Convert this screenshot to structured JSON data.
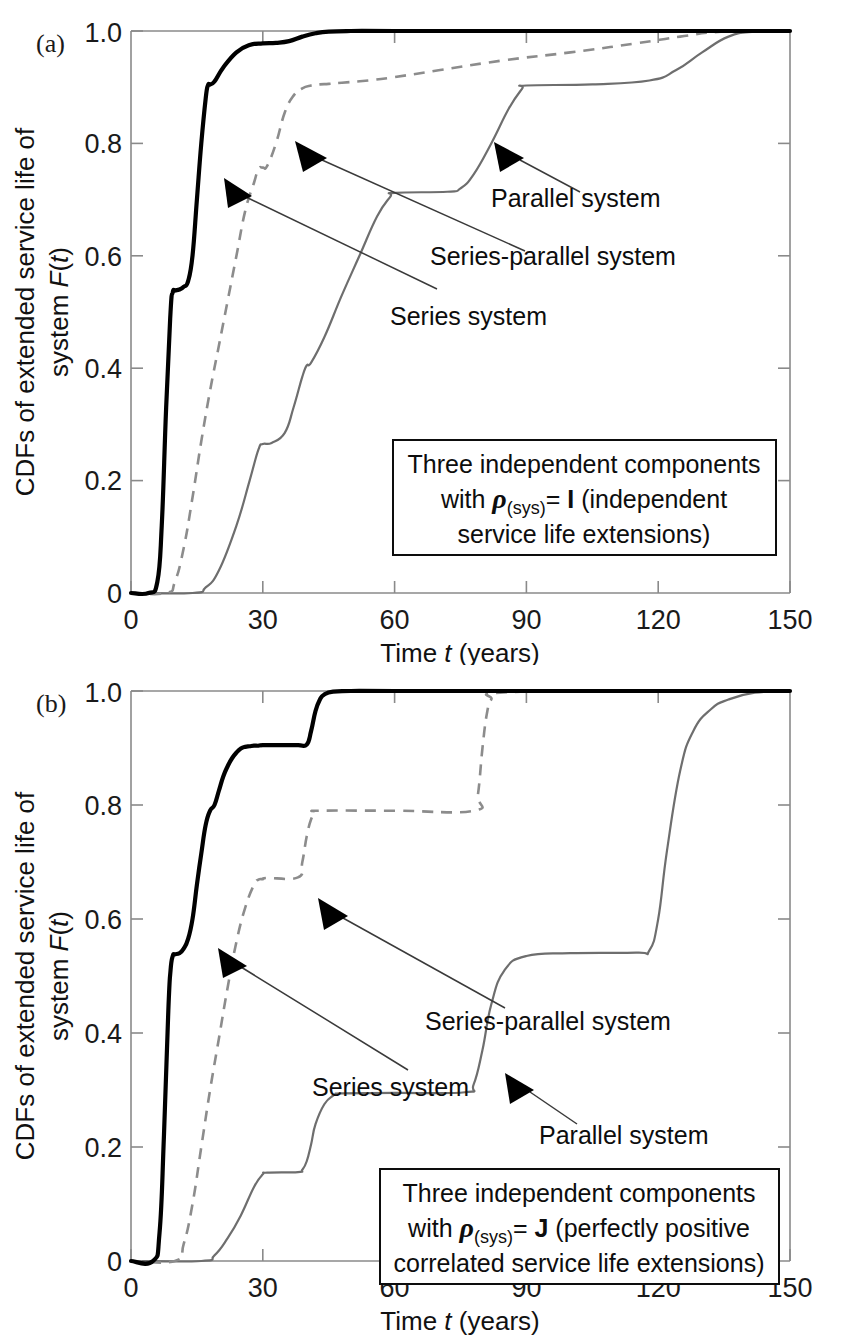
{
  "figure": {
    "panels": [
      {
        "tag": "(a)",
        "box_lines": [
          "Three independent components",
          "with ρ(sys)= I (independent",
          "service life extensions)"
        ],
        "box_line1": "Three independent components",
        "box_line2_pre": "with ",
        "box_line2_sym": "ρ",
        "box_line2_sub": "(sys)",
        "box_line2_post": "= ",
        "box_line2_matrix": "I",
        "box_line2_tail": " (independent",
        "box_line3": "service life extensions)",
        "labels": {
          "series": "Series system",
          "series_parallel": "Series-parallel  system",
          "parallel": "Parallel system"
        }
      },
      {
        "tag": "(b)",
        "box_lines": [
          "Three independent components",
          "with ρ(sys)= J (perfectly positive",
          "correlated service life extensions)"
        ],
        "box_line1": "Three independent components",
        "box_line2_pre": "with ",
        "box_line2_sym": "ρ",
        "box_line2_sub": "(sys)",
        "box_line2_post": "= ",
        "box_line2_matrix": "J",
        "box_line2_tail": " (perfectly positive",
        "box_line3": "correlated service life extensions)",
        "labels": {
          "series": "Series system",
          "series_parallel": "Series-parallel  system",
          "parallel": "Parallel system"
        }
      }
    ],
    "axis": {
      "xlabel_pre": "Time ",
      "xlabel_var": "t",
      "xlabel_post": " (years)",
      "ylabel_line1": "CDFs of extended service life of",
      "ylabel_line2_pre": "system ",
      "ylabel_line2_var": "F",
      "ylabel_line2_post": "(",
      "ylabel_line2_var2": "t",
      "ylabel_line2_end": ")",
      "xticks": [
        "0",
        "30",
        "60",
        "90",
        "120",
        "150"
      ],
      "yticks": [
        "0",
        "0.2",
        "0.4",
        "0.6",
        "0.8",
        "1.0"
      ]
    }
  },
  "chart_data": [
    {
      "type": "line",
      "panel": "(a)",
      "title": "CDFs of extended service life of system F(t) — independent service life extensions",
      "xlabel": "Time t (years)",
      "ylabel": "CDFs of extended service life of system F(t)",
      "xlim": [
        0,
        150
      ],
      "ylim": [
        0,
        1.0
      ],
      "xticks": [
        0,
        30,
        60,
        90,
        120,
        150
      ],
      "yticks": [
        0,
        0.2,
        0.4,
        0.6,
        0.8,
        1.0
      ],
      "grid": false,
      "legend": "inline annotations with arrows",
      "annotation_box": "Three independent components with rho_(sys)= I (independent service life extensions)",
      "series": [
        {
          "name": "Series system",
          "style": "solid-thick-black",
          "x": [
            0,
            4,
            6,
            7,
            8,
            9,
            9.5,
            10,
            11,
            12,
            13,
            14,
            15,
            16,
            17,
            17.5,
            18,
            19,
            21,
            24,
            27,
            30,
            33,
            36,
            39,
            42,
            45,
            50,
            60,
            80,
            100,
            120,
            150
          ],
          "y": [
            0,
            0.0,
            0.02,
            0.12,
            0.33,
            0.5,
            0.535,
            0.538,
            0.54,
            0.545,
            0.555,
            0.6,
            0.7,
            0.8,
            0.88,
            0.903,
            0.905,
            0.91,
            0.935,
            0.962,
            0.975,
            0.978,
            0.979,
            0.982,
            0.99,
            0.996,
            0.999,
            1.0,
            1.0,
            1.0,
            1.0,
            1.0,
            1.0
          ]
        },
        {
          "name": "Series-parallel  system",
          "style": "dashed-gray",
          "x": [
            0,
            8,
            10,
            12,
            14,
            16,
            18,
            20,
            22,
            24,
            26,
            28,
            29,
            30,
            31,
            33,
            35,
            37,
            39,
            41,
            43,
            45,
            48,
            54,
            60,
            70,
            85,
            100,
            115,
            125,
            135,
            150
          ],
          "y": [
            0,
            0.0,
            0.02,
            0.08,
            0.17,
            0.27,
            0.36,
            0.44,
            0.52,
            0.6,
            0.68,
            0.73,
            0.755,
            0.757,
            0.76,
            0.8,
            0.855,
            0.885,
            0.898,
            0.903,
            0.905,
            0.906,
            0.908,
            0.912,
            0.918,
            0.93,
            0.948,
            0.962,
            0.978,
            0.99,
            0.999,
            1.0
          ]
        },
        {
          "name": "Parallel system",
          "style": "solid-thin-gray",
          "x": [
            0,
            14,
            17,
            20,
            24,
            27,
            29,
            30,
            32,
            35,
            37,
            39,
            40,
            41,
            44,
            48,
            52,
            56,
            59,
            60,
            72,
            75,
            78,
            82,
            86,
            89,
            90,
            105,
            118,
            124,
            130,
            136,
            142,
            150
          ],
          "y": [
            0,
            0.0,
            0.01,
            0.04,
            0.12,
            0.2,
            0.255,
            0.265,
            0.267,
            0.285,
            0.33,
            0.385,
            0.405,
            0.41,
            0.455,
            0.53,
            0.6,
            0.67,
            0.705,
            0.712,
            0.714,
            0.72,
            0.745,
            0.8,
            0.862,
            0.897,
            0.903,
            0.905,
            0.912,
            0.93,
            0.962,
            0.99,
            0.999,
            1.0
          ]
        }
      ]
    },
    {
      "type": "line",
      "panel": "(b)",
      "title": "CDFs of extended service life of system F(t) — perfectly positive correlated service life extensions",
      "xlabel": "Time t (years)",
      "ylabel": "CDFs of extended service life of system F(t)",
      "xlim": [
        0,
        150
      ],
      "ylim": [
        0,
        1.0
      ],
      "xticks": [
        0,
        30,
        60,
        90,
        120,
        150
      ],
      "yticks": [
        0,
        0.2,
        0.4,
        0.6,
        0.8,
        1.0
      ],
      "grid": false,
      "legend": "inline annotations with arrows",
      "annotation_box": "Three independent components with rho_(sys)= J (perfectly positive correlated service life extensions)",
      "series": [
        {
          "name": "Series system",
          "style": "solid-thick-black",
          "x": [
            0,
            5,
            6.5,
            7.5,
            8.5,
            9,
            9.5,
            10,
            11,
            12,
            13,
            14,
            15,
            16,
            17,
            18,
            19,
            20,
            21,
            22,
            23,
            24,
            25,
            26,
            27,
            28,
            29,
            30,
            34,
            38,
            40,
            41,
            42,
            43,
            44,
            46,
            50,
            60,
            90,
            120,
            150
          ],
          "y": [
            0,
            0.0,
            0.05,
            0.22,
            0.44,
            0.51,
            0.535,
            0.538,
            0.54,
            0.548,
            0.565,
            0.6,
            0.66,
            0.715,
            0.765,
            0.79,
            0.8,
            0.825,
            0.85,
            0.868,
            0.882,
            0.892,
            0.899,
            0.902,
            0.903,
            0.904,
            0.904,
            0.905,
            0.905,
            0.905,
            0.906,
            0.93,
            0.965,
            0.985,
            0.994,
            0.999,
            1.0,
            1.0,
            1.0,
            1.0,
            1.0
          ]
        },
        {
          "name": "Series-parallel  system",
          "style": "dashed-gray",
          "x": [
            0,
            10,
            12,
            14,
            16,
            18,
            20,
            22,
            24,
            26,
            28,
            29,
            30,
            31,
            38,
            39,
            40,
            41,
            42,
            43,
            60,
            78,
            79,
            80,
            81,
            82,
            84,
            110,
            150
          ],
          "y": [
            0,
            0.0,
            0.03,
            0.1,
            0.2,
            0.3,
            0.39,
            0.48,
            0.56,
            0.62,
            0.66,
            0.669,
            0.67,
            0.672,
            0.673,
            0.7,
            0.745,
            0.775,
            0.787,
            0.79,
            0.79,
            0.79,
            0.82,
            0.9,
            0.96,
            0.985,
            0.997,
            1.0,
            1.0
          ]
        },
        {
          "name": "Parallel system",
          "style": "solid-thin-gray",
          "x": [
            0,
            16,
            19,
            22,
            25,
            28,
            30,
            31,
            38,
            39,
            40,
            41,
            42,
            44,
            46,
            47,
            48,
            60,
            76,
            78,
            80,
            82,
            85,
            90,
            100,
            115,
            118,
            120,
            122,
            125,
            128,
            132,
            136,
            142,
            150
          ],
          "y": [
            0,
            0.0,
            0.01,
            0.04,
            0.08,
            0.13,
            0.152,
            0.155,
            0.156,
            0.16,
            0.175,
            0.205,
            0.24,
            0.275,
            0.29,
            0.293,
            0.294,
            0.295,
            0.296,
            0.31,
            0.37,
            0.45,
            0.51,
            0.535,
            0.54,
            0.541,
            0.545,
            0.6,
            0.72,
            0.86,
            0.93,
            0.968,
            0.985,
            0.997,
            1.0
          ]
        }
      ]
    }
  ]
}
